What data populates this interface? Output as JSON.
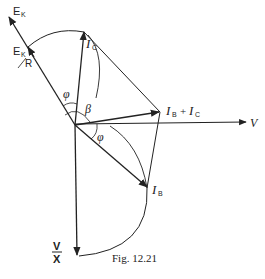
{
  "figure": {
    "caption": "Fig. 12.21",
    "labels": {
      "ek": "E",
      "ek_sub": "K",
      "ek_r_num": "E",
      "ek_r_sub": "K",
      "ek_r_den": "R",
      "ic": "I",
      "ic_sub": "C",
      "ib_plus_ic": "I",
      "ib_plus_ic_sub1": "B",
      "ib_plus_ic_plus": "+",
      "ib_plus_ic_2": "I",
      "ib_plus_ic_sub2": "C",
      "v": "V",
      "ib": "I",
      "ib_sub": "B",
      "v_over_x_num": "V",
      "v_over_x_den": "X",
      "phi_top": "φ",
      "beta": "β",
      "phi_bottom": "φ"
    },
    "colors": {
      "line": "#222222",
      "background": "#ffffff"
    }
  }
}
